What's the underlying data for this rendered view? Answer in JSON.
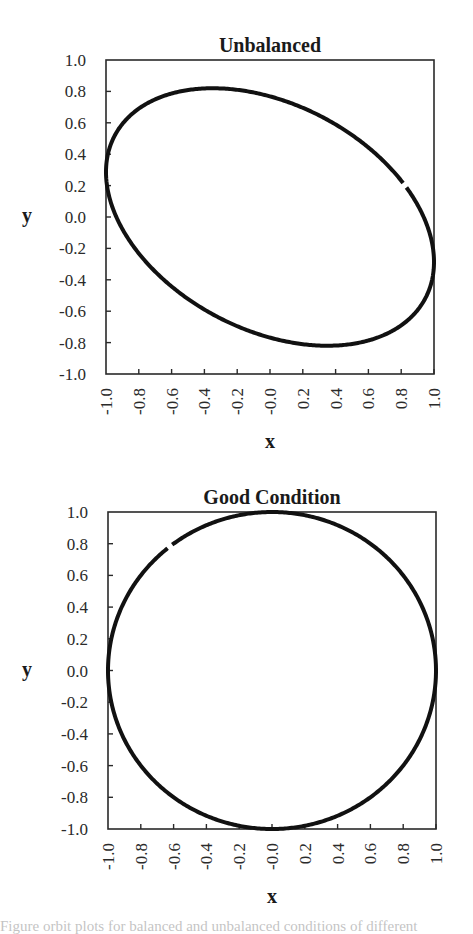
{
  "chart_data": [
    {
      "type": "line",
      "subtype": "parametric-orbit",
      "title": "Unbalanced",
      "xlabel": "x",
      "ylabel": "y",
      "xlim": [
        -1.0,
        1.0
      ],
      "ylim": [
        -1.0,
        1.0
      ],
      "x_ticks": [
        "-1.0",
        "-0.8",
        "-0.6",
        "-0.4",
        "-0.2",
        "-0.0",
        "0.2",
        "0.4",
        "0.6",
        "0.8",
        "1.0"
      ],
      "y_ticks": [
        "1.0",
        "0.8",
        "0.6",
        "0.4",
        "0.2",
        "0.0",
        "-0.2",
        "-0.4",
        "-0.6",
        "-0.8",
        "-1.0"
      ],
      "grid": false,
      "legend": null,
      "series": [
        {
          "name": "orbit",
          "shape": "tilted ellipse",
          "equation": "x = cos(t), y = -0.82*sin(t + 0.357)",
          "key_points": [
            {
              "x": -1.0,
              "y": 0.27
            },
            {
              "x": -0.35,
              "y": 0.82
            },
            {
              "x": 0.82,
              "y": 0.2
            },
            {
              "x": 1.0,
              "y": -0.27
            },
            {
              "x": 0.35,
              "y": -0.82
            }
          ],
          "gap_at": {
            "x": 0.82,
            "y": 0.2
          }
        }
      ],
      "plot_box_px": {
        "left": 106,
        "top": 60,
        "right": 434,
        "bottom": 374
      }
    },
    {
      "type": "line",
      "subtype": "parametric-orbit",
      "title": "Good Condition",
      "xlabel": "x",
      "ylabel": "y",
      "xlim": [
        -1.0,
        1.0
      ],
      "ylim": [
        -1.0,
        1.0
      ],
      "x_ticks": [
        "-1.0",
        "-0.8",
        "-0.6",
        "-0.4",
        "-0.2",
        "-0.0",
        "0.2",
        "0.4",
        "0.6",
        "0.8",
        "1.0"
      ],
      "y_ticks": [
        "1.0",
        "0.8",
        "0.6",
        "0.4",
        "0.2",
        "0.0",
        "-0.2",
        "-0.4",
        "-0.6",
        "-0.8",
        "-1.0"
      ],
      "grid": false,
      "legend": null,
      "series": [
        {
          "name": "orbit",
          "shape": "circle",
          "equation": "x = cos(t), y = sin(t)",
          "key_points": [
            {
              "x": -1.0,
              "y": 0.0
            },
            {
              "x": 0.0,
              "y": 1.0
            },
            {
              "x": 1.0,
              "y": 0.0
            },
            {
              "x": 0.0,
              "y": -1.0
            }
          ],
          "gap_at": {
            "x": -0.62,
            "y": 0.78
          }
        }
      ],
      "plot_box_px": {
        "left": 108,
        "top": 512,
        "right": 436,
        "bottom": 829
      }
    }
  ],
  "charts": [
    {
      "title": "Unbalanced",
      "xlabel": "x",
      "ylabel": "y"
    },
    {
      "title": "Good Condition",
      "xlabel": "x",
      "ylabel": "y"
    }
  ],
  "caption_partial": "Figure orbit plots for balanced and unbalanced conditions of different"
}
